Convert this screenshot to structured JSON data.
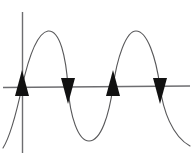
{
  "figure": {
    "title": ""
  },
  "colors": {
    "curve": "#58585a",
    "axis": "#6d6d70",
    "arrow_fill": "#111111",
    "background": "#ffffff"
  },
  "chart_data": {
    "type": "line",
    "title": "",
    "subtitle": "",
    "xlabel": "",
    "ylabel": "",
    "grid": false,
    "legend": null,
    "xlim": [
      -0.25,
      2.25
    ],
    "ylim": [
      -1.25,
      1.25
    ],
    "x_axis": {
      "name": "horizontal-axis",
      "y_value": 0,
      "pixel_y": 87,
      "pixel_x_start": 3,
      "pixel_x_end": 190
    },
    "y_axis": {
      "name": "vertical-axis",
      "x_value": 0,
      "pixel_x": 22,
      "pixel_y_start": 12,
      "pixel_y_end": 153
    },
    "series": [
      {
        "name": "sine",
        "equation": "y = sin(2*pi*x)",
        "cycles": 2,
        "amplitude": 1,
        "x": [
          -0.22,
          -0.125,
          0,
          0.25,
          0.5,
          0.75,
          1.0,
          1.25,
          1.5,
          1.75,
          2.0,
          2.1
        ],
        "values": [
          -0.95,
          -0.71,
          0,
          1,
          0,
          -1,
          0,
          1,
          0,
          -1,
          0,
          -0.62
        ]
      }
    ],
    "annotations": [
      {
        "name": "arrowhead-1",
        "marker": "triangle",
        "direction": "up",
        "x": 0,
        "y": 0,
        "pixel_x": 22,
        "pixel_y": 87,
        "label": "rising zero crossing"
      },
      {
        "name": "arrowhead-2",
        "marker": "triangle",
        "direction": "down",
        "x": 0.5,
        "y": 0,
        "pixel_x": 68,
        "pixel_y": 87,
        "label": "falling zero crossing"
      },
      {
        "name": "arrowhead-3",
        "marker": "triangle",
        "direction": "up",
        "x": 1.0,
        "y": 0,
        "pixel_x": 113,
        "pixel_y": 87,
        "label": "rising zero crossing"
      },
      {
        "name": "arrowhead-4",
        "marker": "triangle",
        "direction": "down",
        "x": 1.5,
        "y": 0,
        "pixel_x": 160,
        "pixel_y": 87,
        "label": "falling zero crossing"
      }
    ],
    "peaks": [
      {
        "name": "peak-1",
        "x": 0.25,
        "y": 1,
        "pixel_x": 48,
        "pixel_y": 31
      },
      {
        "name": "peak-2",
        "x": 1.25,
        "y": 1,
        "pixel_x": 136,
        "pixel_y": 31
      }
    ],
    "troughs": [
      {
        "name": "trough-1",
        "x": 0.75,
        "y": -1,
        "pixel_x": 89,
        "pixel_y": 141
      }
    ]
  },
  "paths": {
    "sine_curve": "M 3,148 C 8,140 14,124 22,87 C 28,60 36,33 48,31 C 60,30 66,57 68,87 C 70,116 78,141 89,141 C 101,141 109,115 113,87 C 117,58 126,31 136,31 C 147,31 156,57 160,87 C 163,110 172,136 190,146",
    "x_axis_line": "M 3,87.5 L 190,86",
    "y_axis_line": "M 22.5,12 L 22.5,153"
  },
  "arrow_shapes": {
    "up": "M 0,-17 L 7,9 L -7,9 Z",
    "down": "M 0,17 L 7,-9 L -7,-9 Z"
  }
}
